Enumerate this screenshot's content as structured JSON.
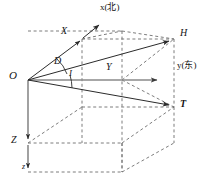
{
  "figure": {
    "type": "3d-vector-diagram",
    "background_color": "#ffffff",
    "line_color": "#2b2b2b",
    "axis_color": "#8a8a8a",
    "dash_color": "#6e6e6e",
    "text_color": "#141414"
  },
  "labels": {
    "origin": "O",
    "x_axis": "x(北)",
    "y_axis": "y(东)",
    "z_axis_lower": "z",
    "component_x": "X",
    "component_y": "Y",
    "component_z": "Z",
    "vector_h": "H",
    "vector_t": "T",
    "angle_declination": "D",
    "angle_inclination": "I"
  },
  "label_positions": {
    "origin": {
      "x": 9,
      "y": 70
    },
    "x_axis": {
      "x": 101,
      "y": 4
    },
    "y_axis": {
      "x": 178,
      "y": 64
    },
    "z_axis_lower": {
      "x": 22,
      "y": 165
    },
    "component_x": {
      "x": 62,
      "y": 27
    },
    "component_y": {
      "x": 106,
      "y": 64
    },
    "component_z": {
      "x": 12,
      "y": 137
    },
    "vector_h": {
      "x": 180,
      "y": 29
    },
    "vector_t": {
      "x": 180,
      "y": 101
    },
    "angle_declination": {
      "x": 54,
      "y": 58
    },
    "angle_inclination": {
      "x": 68,
      "y": 71
    }
  },
  "geometry": {
    "origin": {
      "x": 28,
      "y": 80
    },
    "box_front_top_left": {
      "x": 28,
      "y": 80
    },
    "box_top_near_left": {
      "x": 82,
      "y": 39
    },
    "box_top_near_right": {
      "x": 174,
      "y": 39
    },
    "box_bottom_right_front": {
      "x": 174,
      "y": 107
    },
    "box_far_vertical_x": 122,
    "z_arrow_mid": {
      "x": 28,
      "y": 143
    },
    "z_arrow_end": {
      "x": 28,
      "y": 172
    },
    "y_axis_arrow_end": {
      "x": 161,
      "y": 80
    },
    "x_axis_arrow_end": {
      "x": 101,
      "y": 22
    },
    "h_vector_end": {
      "x": 172,
      "y": 40
    },
    "t_vector_end": {
      "x": 172,
      "y": 106
    }
  }
}
